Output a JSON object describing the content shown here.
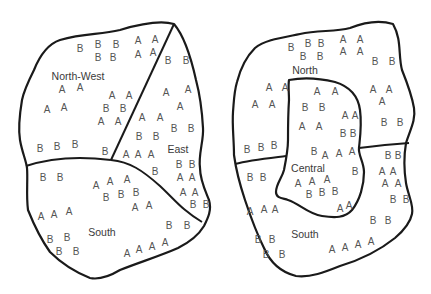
{
  "figure": {
    "left_map": {
      "regions": [
        {
          "label": "North-West",
          "label_pos": [
            78,
            76
          ]
        },
        {
          "label": "East",
          "label_pos": [
            178,
            149
          ]
        },
        {
          "label": "South",
          "label_pos": [
            102,
            232
          ]
        }
      ],
      "marks": [
        [
          "B",
          80,
          49
        ],
        [
          "B",
          98,
          45
        ],
        [
          "B",
          116,
          45
        ],
        [
          "A",
          138,
          41
        ],
        [
          "A",
          155,
          40
        ],
        [
          "B",
          98,
          58
        ],
        [
          "B",
          113,
          58
        ],
        [
          "A",
          138,
          55
        ],
        [
          "A",
          153,
          53
        ],
        [
          "A",
          62,
          90
        ],
        [
          "A",
          80,
          88
        ],
        [
          "A",
          112,
          96
        ],
        [
          "A",
          129,
          96
        ],
        [
          "A",
          47,
          110
        ],
        [
          "A",
          64,
          108
        ],
        [
          "B",
          106,
          109
        ],
        [
          "B",
          123,
          109
        ],
        [
          "A",
          101,
          122
        ],
        [
          "A",
          118,
          122
        ],
        [
          "B",
          40,
          149
        ],
        [
          "B",
          57,
          147
        ],
        [
          "B",
          75,
          145
        ],
        [
          "B",
          105,
          152
        ],
        [
          "B",
          168,
          61
        ],
        [
          "B",
          186,
          61
        ],
        [
          "A",
          166,
          93
        ],
        [
          "A",
          188,
          90
        ],
        [
          "A",
          180,
          107
        ],
        [
          "A",
          142,
          118
        ],
        [
          "A",
          160,
          118
        ],
        [
          "B",
          174,
          129
        ],
        [
          "B",
          191,
          129
        ],
        [
          "B",
          139,
          137
        ],
        [
          "B",
          156,
          137
        ],
        [
          "A",
          126,
          155
        ],
        [
          "A",
          138,
          155
        ],
        [
          "A",
          151,
          155
        ],
        [
          "B",
          179,
          165
        ],
        [
          "B",
          192,
          165
        ],
        [
          "B",
          155,
          172
        ],
        [
          "A",
          180,
          178
        ],
        [
          "A",
          192,
          178
        ],
        [
          "A",
          183,
          193
        ],
        [
          "A",
          195,
          193
        ],
        [
          "B",
          193,
          205
        ],
        [
          "B",
          206,
          205
        ],
        [
          "B",
          43,
          178
        ],
        [
          "B",
          60,
          178
        ],
        [
          "A",
          96,
          186
        ],
        [
          "A",
          110,
          182
        ],
        [
          "A",
          127,
          180
        ],
        [
          "B",
          106,
          198
        ],
        [
          "B",
          121,
          195
        ],
        [
          "B",
          136,
          193
        ],
        [
          "A",
          41,
          217
        ],
        [
          "A",
          54,
          215
        ],
        [
          "A",
          69,
          212
        ],
        [
          "A",
          135,
          208
        ],
        [
          "A",
          149,
          206
        ],
        [
          "B",
          169,
          226
        ],
        [
          "B",
          187,
          226
        ],
        [
          "B",
          50,
          240
        ],
        [
          "B",
          67,
          238
        ],
        [
          "B",
          59,
          252
        ],
        [
          "B",
          76,
          252
        ],
        [
          "A",
          127,
          254
        ],
        [
          "A",
          139,
          250
        ],
        [
          "A",
          152,
          247
        ],
        [
          "A",
          165,
          243
        ]
      ]
    },
    "right_map": {
      "regions": [
        {
          "label": "North",
          "label_pos": [
            305,
            70
          ]
        },
        {
          "label": "Central",
          "label_pos": [
            308,
            168
          ]
        },
        {
          "label": "South",
          "label_pos": [
            305,
            234
          ]
        }
      ],
      "marks": [
        [
          "B",
          291,
          48
        ],
        [
          "B",
          308,
          44
        ],
        [
          "B",
          321,
          44
        ],
        [
          "A",
          343,
          40
        ],
        [
          "A",
          360,
          40
        ],
        [
          "B",
          303,
          57
        ],
        [
          "B",
          320,
          57
        ],
        [
          "A",
          343,
          52
        ],
        [
          "A",
          360,
          52
        ],
        [
          "B",
          375,
          62
        ],
        [
          "B",
          392,
          62
        ],
        [
          "A",
          269,
          88
        ],
        [
          "A",
          285,
          88
        ],
        [
          "A",
          255,
          105
        ],
        [
          "A",
          272,
          105
        ],
        [
          "A",
          317,
          92
        ],
        [
          "A",
          335,
          92
        ],
        [
          "A",
          373,
          90
        ],
        [
          "A",
          389,
          90
        ],
        [
          "A",
          382,
          102
        ],
        [
          "B",
          305,
          108
        ],
        [
          "B",
          322,
          108
        ],
        [
          "A",
          345,
          116
        ],
        [
          "A",
          355,
          116
        ],
        [
          "A",
          302,
          127
        ],
        [
          "A",
          319,
          127
        ],
        [
          "B",
          343,
          134
        ],
        [
          "B",
          353,
          134
        ],
        [
          "B",
          384,
          123
        ],
        [
          "B",
          400,
          123
        ],
        [
          "B",
          247,
          150
        ],
        [
          "B",
          261,
          148
        ],
        [
          "B",
          274,
          146
        ],
        [
          "B",
          314,
          152
        ],
        [
          "A",
          325,
          156
        ],
        [
          "A",
          339,
          154
        ],
        [
          "A",
          352,
          152
        ],
        [
          "B",
          355,
          172
        ],
        [
          "A",
          298,
          184
        ],
        [
          "A",
          312,
          182
        ],
        [
          "A",
          327,
          180
        ],
        [
          "B",
          309,
          195
        ],
        [
          "B",
          322,
          193
        ],
        [
          "B",
          335,
          192
        ],
        [
          "A",
          340,
          209
        ],
        [
          "A",
          349,
          206
        ],
        [
          "B",
          388,
          156
        ],
        [
          "B",
          398,
          156
        ],
        [
          "A",
          382,
          172
        ],
        [
          "A",
          393,
          172
        ],
        [
          "A",
          385,
          184
        ],
        [
          "A",
          398,
          184
        ],
        [
          "B",
          393,
          200
        ],
        [
          "B",
          406,
          200
        ],
        [
          "B",
          250,
          178
        ],
        [
          "B",
          263,
          178
        ],
        [
          "A",
          250,
          212
        ],
        [
          "A",
          264,
          210
        ],
        [
          "A",
          275,
          210
        ],
        [
          "B",
          373,
          221
        ],
        [
          "B",
          388,
          221
        ],
        [
          "B",
          258,
          240
        ],
        [
          "B",
          272,
          240
        ],
        [
          "B",
          266,
          255
        ],
        [
          "B",
          282,
          255
        ],
        [
          "A",
          332,
          250
        ],
        [
          "A",
          345,
          248
        ],
        [
          "A",
          358,
          245
        ],
        [
          "A",
          371,
          242
        ]
      ]
    }
  }
}
